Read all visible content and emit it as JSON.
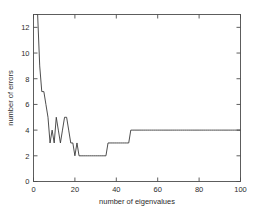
{
  "figure": {
    "background_color": "#ffffff",
    "frame_color": "#4d4d4d",
    "line_color": "#3a3a3a"
  },
  "chart_data": {
    "type": "line",
    "title": "",
    "xlabel": "number of eigenvalues",
    "ylabel": "number of errors",
    "xlim": [
      0,
      100
    ],
    "ylim": [
      0,
      13
    ],
    "grid": false,
    "legend": null,
    "xticks": [
      0,
      20,
      40,
      60,
      80,
      100
    ],
    "xtick_labels": [
      "0",
      "20",
      "40",
      "60",
      "80",
      "100"
    ],
    "yticks": [
      0,
      2,
      4,
      6,
      8,
      10,
      12
    ],
    "ytick_labels": [
      "0",
      "2",
      "4",
      "6",
      "8",
      "10",
      "12"
    ],
    "series": [
      {
        "name": "errors",
        "color": "#3a3a3a",
        "x": [
          1,
          2,
          3,
          4,
          5,
          6,
          7,
          8,
          9,
          10,
          11,
          12,
          13,
          14,
          15,
          16,
          17,
          18,
          19,
          20,
          21,
          22,
          23,
          24,
          25,
          26,
          27,
          28,
          29,
          30,
          31,
          32,
          33,
          34,
          35,
          36,
          37,
          38,
          39,
          40,
          41,
          42,
          43,
          44,
          45,
          46,
          47,
          48,
          49,
          50,
          51,
          52,
          53,
          54,
          55,
          56,
          57,
          58,
          59,
          60,
          61,
          62,
          63,
          64,
          65,
          66,
          67,
          68,
          69,
          70,
          71,
          72,
          73,
          74,
          75,
          76,
          77,
          78,
          79,
          80,
          81,
          82,
          83,
          84,
          85,
          86,
          87,
          88,
          89,
          90,
          91,
          92,
          93,
          94,
          95,
          96,
          97,
          98,
          99,
          100
        ],
        "y": [
          13,
          13,
          9,
          7,
          7,
          6,
          5,
          3,
          4,
          3,
          5,
          4,
          3,
          4,
          5,
          5,
          4,
          3,
          3,
          2,
          3,
          2,
          2,
          2,
          2,
          2,
          2,
          2,
          2,
          2,
          2,
          2,
          2,
          2,
          2,
          3,
          3,
          3,
          3,
          3,
          3,
          3,
          3,
          3,
          3,
          3,
          4,
          4,
          4,
          4,
          4,
          4,
          4,
          4,
          4,
          4,
          4,
          4,
          4,
          4,
          4,
          4,
          4,
          4,
          4,
          4,
          4,
          4,
          4,
          4,
          4,
          4,
          4,
          4,
          4,
          4,
          4,
          4,
          4,
          4,
          4,
          4,
          4,
          4,
          4,
          4,
          4,
          4,
          4,
          4,
          4,
          4,
          4,
          4,
          4,
          4,
          4,
          4,
          4,
          4
        ]
      }
    ]
  }
}
